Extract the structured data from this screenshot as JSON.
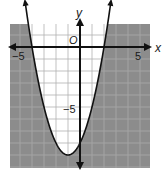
{
  "chart_data": {
    "type": "line",
    "title": "",
    "xlabel": "x",
    "ylabel": "y",
    "origin_label": "O",
    "xlim": [
      -6,
      6
    ],
    "ylim": [
      -10,
      2
    ],
    "tick_labels": {
      "x": [
        {
          "value": -5,
          "label": "−5"
        },
        {
          "value": 5,
          "label": "5"
        }
      ],
      "y": [
        {
          "value": -5,
          "label": "−5"
        }
      ]
    },
    "grid": true,
    "grid_step": 1,
    "series": [
      {
        "name": "boundary",
        "equation": "y = x^2 + 2x - 8",
        "line_style": "solid",
        "roots": [
          -4,
          2
        ],
        "vertex": [
          -1,
          -9
        ],
        "y_intercept": -8,
        "x": [
          -4.6,
          -4,
          -3,
          -2,
          -1,
          0,
          1,
          2,
          2.6
        ],
        "y": [
          2.36,
          0,
          -5,
          -8,
          -9,
          -8,
          -5,
          0,
          2.36
        ]
      }
    ],
    "shaded_region": "outside parabola (y < x^2 + 2x - 8)",
    "colors": {
      "shade": "#8c8c8c",
      "unshaded": "#ffffff",
      "grid_light": "#c8c8c8",
      "grid_dark": "#6e6e6e",
      "axis": "#111111",
      "curve": "#111111"
    }
  }
}
